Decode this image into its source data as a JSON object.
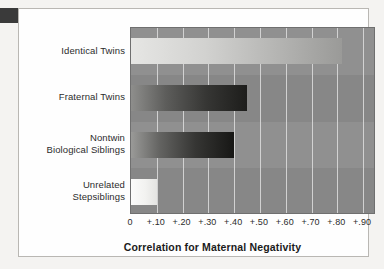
{
  "chart_data": {
    "type": "bar",
    "orientation": "horizontal",
    "title": "",
    "xlabel": "Correlation for Maternal Negativity",
    "ylabel": "",
    "categories": [
      "Identical Twins",
      "Fraternal Twins",
      "Nontwin Biological Siblings",
      "Unrelated Stepsiblings"
    ],
    "category_lines": [
      [
        "Identical Twins"
      ],
      [
        "Fraternal Twins"
      ],
      [
        "Nontwin",
        "Biological Siblings"
      ],
      [
        "Unrelated",
        "Stepsiblings"
      ]
    ],
    "values": [
      0.82,
      0.45,
      0.4,
      0.1
    ],
    "xlim": [
      0,
      0.95
    ],
    "xticks": [
      0,
      0.1,
      0.2,
      0.3,
      0.4,
      0.5,
      0.6,
      0.7,
      0.8,
      0.9
    ],
    "xticklabels": [
      "0",
      "+.10",
      "+.20",
      "+.30",
      "+.40",
      "+.50",
      "+.60",
      "+.70",
      "+.80",
      "+.90"
    ],
    "grid": "vertical",
    "legend": "none",
    "plot_background": "#8c8c8c",
    "gridline_color": "#dedede",
    "bar_colors": [
      "#d2d2d0",
      "#363634",
      "#2a2a28",
      "#f2f2f0"
    ]
  },
  "figure": {
    "background": "#f4f3f1",
    "frame_color": "#b9b7b3",
    "corner_block_color": "#3a3a3a"
  }
}
